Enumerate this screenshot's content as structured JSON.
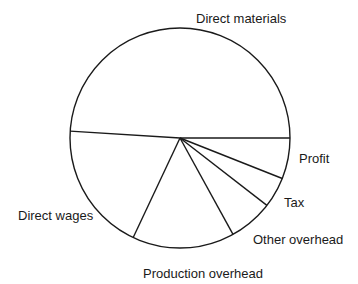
{
  "chart_data": {
    "type": "pie",
    "title": "",
    "start_angle_deg": 0,
    "direction": "mixed",
    "categories": [
      "Direct materials",
      "Direct wages",
      "Production overhead",
      "Other overhead",
      "Tax",
      "Profit"
    ],
    "values": [
      49,
      19,
      15,
      6.5,
      4.5,
      6
    ],
    "unit": "% (estimated from slice angles)",
    "labels_outside": true,
    "legend": "none",
    "colors": {
      "stroke": "#1a1a1a",
      "fill": "#ffffff"
    }
  },
  "labels": {
    "direct_materials": "Direct materials",
    "direct_wages": "Direct wages",
    "production_overhead": "Production overhead",
    "other_overhead": "Other overhead",
    "tax": "Tax",
    "profit": "Profit"
  }
}
